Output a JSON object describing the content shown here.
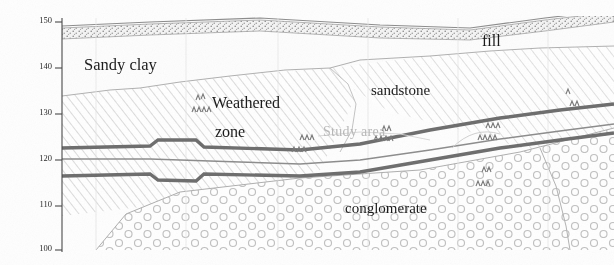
{
  "figure": {
    "type": "geological-cross-section",
    "width": 614,
    "height": 265,
    "background": "#fefefe"
  },
  "axis": {
    "name": "elevation-axis",
    "orientation": "vertical",
    "unit": "m",
    "min": 100,
    "max": 150,
    "ticks": [
      {
        "label": "150",
        "value": 150,
        "y": 22
      },
      {
        "label": "140",
        "value": 140,
        "y": 68
      },
      {
        "label": "130",
        "value": 130,
        "y": 114
      },
      {
        "label": "120",
        "value": 120,
        "y": 160
      },
      {
        "label": "110",
        "value": 110,
        "y": 206
      },
      {
        "label": "100",
        "value": 100,
        "y": 250
      }
    ],
    "axis_line_x": 62
  },
  "labels": {
    "sandy_clay": "Sandy clay",
    "weathered_line1": "Weathered",
    "weathered_line2": "zone",
    "sandstone": "sandstone",
    "fill": "fill",
    "conglomerate": "conglomerate",
    "study_area": "Study area"
  },
  "strata": [
    {
      "name": "fill",
      "pattern": "stipple",
      "color": "#8a8a8a"
    },
    {
      "name": "sandy-clay",
      "pattern": "blank",
      "color": "#fdfdfd"
    },
    {
      "name": "weathered-zone",
      "pattern": "diagonal-hatch",
      "color": "#b5b5b5"
    },
    {
      "name": "sandstone",
      "pattern": "diagonal-hatch",
      "color": "#b5b5b5"
    },
    {
      "name": "conglomerate",
      "pattern": "circles",
      "color": "#c0c0c0"
    }
  ],
  "tunnel": {
    "name": "tunnel-alignment",
    "line_color": "#6e6e6e",
    "lines": [
      "crown",
      "centerline",
      "invert"
    ],
    "approx_elevation_left": 122,
    "approx_elevation_right": 131
  },
  "colors": {
    "hatch": "#b9b9b9",
    "circle_outline": "#c3c3c3",
    "tunnel": "#6f6f6f",
    "boundary": "#a7a7a7",
    "grid": "#e2e2e2",
    "text": "#1b1b1b",
    "study_text": "#b9b9b9"
  }
}
